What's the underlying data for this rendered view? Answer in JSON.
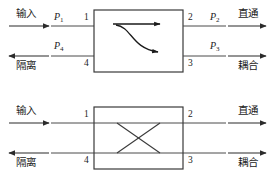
{
  "figure": {
    "type": "directional-coupler-port-diagram",
    "line_color": "#3a3a3a",
    "box_color": "#3a3a3a",
    "text_color": "#1c1c1c",
    "background": "#ffffff"
  },
  "diagrams": [
    {
      "id": "top",
      "inner_symbol": "branching-arrow",
      "labels": {
        "input": "输入",
        "isolated": "隔离",
        "through": "直通",
        "coupled": "耦合"
      },
      "powers": {
        "p1": "P",
        "p1_sub": "1",
        "p2": "P",
        "p2_sub": "2",
        "p3": "P",
        "p3_sub": "3",
        "p4": "P",
        "p4_sub": "4"
      },
      "ports": {
        "port1": "1",
        "port2": "2",
        "port3": "3",
        "port4": "4"
      }
    },
    {
      "id": "bottom",
      "inner_symbol": "cross-x",
      "labels": {
        "input": "输入",
        "isolated": "隔离",
        "through": "直通",
        "coupled": "耦合"
      },
      "ports": {
        "port1": "1",
        "port2": "2",
        "port3": "3",
        "port4": "4"
      }
    }
  ]
}
